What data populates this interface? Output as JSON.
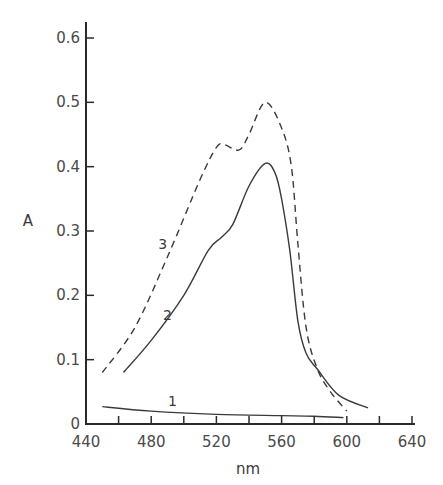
{
  "chart_data": {
    "type": "line",
    "title": "",
    "xlabel": "nm",
    "ylabel": "A",
    "xlim": [
      440,
      640
    ],
    "ylim": [
      0,
      0.6
    ],
    "xticks": [
      440,
      480,
      520,
      560,
      600,
      640
    ],
    "xticks_minor": [
      460,
      500,
      540,
      580,
      620
    ],
    "xtick_labels": [
      "440",
      "480",
      "520",
      "560",
      "600",
      "640"
    ],
    "yticks": [
      0,
      0.1,
      0.2,
      0.3,
      0.4,
      0.5,
      0.6
    ],
    "ytick_labels": [
      "0",
      "0.1",
      "0.2",
      "0.3",
      "0.4",
      "0.5",
      "0.6"
    ],
    "grid": false,
    "legend": "inline curve labels",
    "series": [
      {
        "name": "1",
        "style": "solid",
        "label_pos": [
          493,
          0.035
        ],
        "x": [
          450,
          480,
          520,
          560,
          580,
          598
        ],
        "y": [
          0.027,
          0.02,
          0.015,
          0.013,
          0.012,
          0.01
        ]
      },
      {
        "name": "2",
        "style": "solid",
        "label_pos": [
          490,
          0.17
        ],
        "x": [
          463,
          480,
          500,
          515,
          523,
          530,
          540,
          550,
          556,
          560,
          565,
          570,
          575,
          582,
          595,
          613
        ],
        "y": [
          0.08,
          0.13,
          0.2,
          0.27,
          0.29,
          0.31,
          0.37,
          0.405,
          0.39,
          0.35,
          0.27,
          0.16,
          0.11,
          0.085,
          0.045,
          0.025
        ]
      },
      {
        "name": "3",
        "style": "dashed",
        "label_pos": [
          487,
          0.28
        ],
        "x": [
          450,
          470,
          490,
          510,
          520,
          525,
          534,
          540,
          550,
          560,
          566,
          570,
          575,
          582,
          590,
          600
        ],
        "y": [
          0.08,
          0.15,
          0.26,
          0.38,
          0.43,
          0.434,
          0.426,
          0.45,
          0.5,
          0.46,
          0.4,
          0.28,
          0.15,
          0.085,
          0.05,
          0.02
        ]
      }
    ]
  },
  "colors": {
    "axis": "#2a2a2a",
    "curve": "#3a3a3a",
    "text": "#4a4a4a",
    "background": "#ffffff"
  }
}
